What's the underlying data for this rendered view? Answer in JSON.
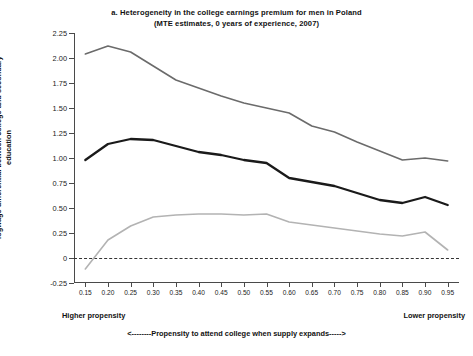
{
  "chart_data": {
    "type": "line",
    "title": "a. Heterogeneity in the college earnings premium for men in Poland",
    "subtitle": "(MTE estimates, 0 years of experience, 2007)",
    "xlabel": "<--------Propensity to attend college when supply expands----->",
    "ylabel": "logwage differential between college and secondary education",
    "xlim": [
      0.125,
      0.975
    ],
    "ylim": [
      -0.25,
      2.25
    ],
    "grid": false,
    "legend": "none",
    "x": [
      0.15,
      0.2,
      0.25,
      0.3,
      0.35,
      0.4,
      0.45,
      0.5,
      0.55,
      0.6,
      0.65,
      0.7,
      0.75,
      0.8,
      0.85,
      0.9,
      0.95
    ],
    "xticks": [
      "0.15",
      "0.20",
      "0.25",
      "0.30",
      "0.35",
      "0.40",
      "0.45",
      "0.50",
      "0.55",
      "0.60",
      "0.65",
      "0.70",
      "0.75",
      "0.80",
      "0.85",
      "0.90",
      "0.95"
    ],
    "yticks": [
      "2.25",
      "2.00",
      "1.75",
      "1.50",
      "1.25",
      "1.00",
      "0.75",
      "0.50",
      "0.25",
      "0",
      "-0.25"
    ],
    "ytick_values": [
      2.25,
      2.0,
      1.75,
      1.5,
      1.25,
      1.0,
      0.75,
      0.5,
      0.25,
      0,
      -0.25
    ],
    "zero_reference_line": 0,
    "series": [
      {
        "name": "upper confidence bound",
        "color": "#6b6b6b",
        "width": 1.6,
        "values": [
          2.04,
          2.12,
          2.06,
          1.92,
          1.78,
          1.7,
          1.62,
          1.55,
          1.5,
          1.45,
          1.32,
          1.26,
          1.16,
          1.07,
          0.98,
          1.0,
          0.97
        ]
      },
      {
        "name": "MTE estimate",
        "color": "#1a1a1a",
        "width": 2.3,
        "values": [
          0.98,
          1.14,
          1.19,
          1.18,
          1.12,
          1.06,
          1.03,
          0.98,
          0.95,
          0.8,
          0.76,
          0.72,
          0.65,
          0.58,
          0.55,
          0.61,
          0.53
        ]
      },
      {
        "name": "lower confidence bound",
        "color": "#b3b3b3",
        "width": 1.6,
        "values": [
          -0.11,
          0.18,
          0.32,
          0.41,
          0.43,
          0.44,
          0.44,
          0.43,
          0.44,
          0.36,
          0.33,
          0.3,
          0.27,
          0.24,
          0.22,
          0.26,
          0.08
        ]
      }
    ],
    "annotations": {
      "left": "Higher propensity",
      "right": "Lower propensity"
    }
  }
}
